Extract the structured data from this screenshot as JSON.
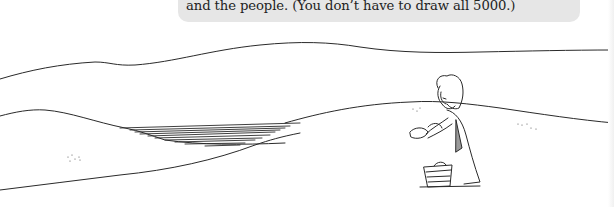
{
  "instruction": {
    "text": "and the people. (You don’t have to draw all 5000.)"
  },
  "illustration": {
    "description": "Line drawing of rolling hills with a lake; a robed bearded figure holds bread above a basket",
    "elements": [
      "hills",
      "lake",
      "figure-with-bread",
      "basket",
      "grass-dots"
    ],
    "colors": {
      "line": "#2a2a2a",
      "box": "#e6e6e6",
      "background": "#ffffff",
      "sash": "#9a9a9a"
    }
  }
}
